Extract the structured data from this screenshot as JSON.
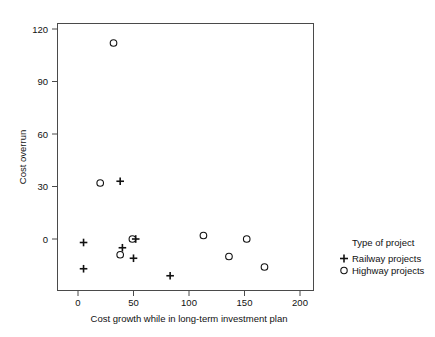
{
  "chart_data": {
    "type": "scatter",
    "title": "",
    "xlabel": "Cost growth while in long-term investment plan",
    "ylabel": "Cost overrun",
    "xlim": [
      -8,
      212
    ],
    "ylim": [
      -27,
      128
    ],
    "xticks": [
      0,
      50,
      100,
      150,
      200
    ],
    "xtick_labels": [
      "0",
      "50",
      "100",
      "150",
      "200"
    ],
    "yticks": [
      0,
      30,
      60,
      90,
      120
    ],
    "ytick_labels": [
      "0",
      "30",
      "60",
      "90",
      "120"
    ],
    "grid": false,
    "legend_position": "right",
    "legend_title": "Type of project",
    "series": [
      {
        "name": "Railway projects",
        "marker": "plus",
        "points": [
          {
            "x": 5,
            "y": -2
          },
          {
            "x": 5,
            "y": -17
          },
          {
            "x": 38,
            "y": 33
          },
          {
            "x": 40,
            "y": -5
          },
          {
            "x": 50,
            "y": -11
          },
          {
            "x": 52,
            "y": 0
          },
          {
            "x": 83,
            "y": -21
          }
        ]
      },
      {
        "name": "Highway projects",
        "marker": "circle",
        "points": [
          {
            "x": 32,
            "y": 112
          },
          {
            "x": 20,
            "y": 32
          },
          {
            "x": 38,
            "y": -9
          },
          {
            "x": 49,
            "y": 0
          },
          {
            "x": 113,
            "y": 2
          },
          {
            "x": 136,
            "y": -10
          },
          {
            "x": 152,
            "y": 0
          },
          {
            "x": 168,
            "y": -16
          }
        ]
      }
    ]
  },
  "legend": {
    "title": "Type of project",
    "entries": [
      {
        "label": "Railway projects",
        "symbol": "+"
      },
      {
        "label": "Highway projects",
        "symbol": "○"
      }
    ]
  },
  "axis": {
    "x_title": "Cost growth while in long-term investment plan",
    "y_title": "Cost overrun"
  },
  "colors": {
    "frame": "#4a4a4a",
    "marker": "#111111",
    "text": "#111111",
    "background": "#ffffff"
  }
}
